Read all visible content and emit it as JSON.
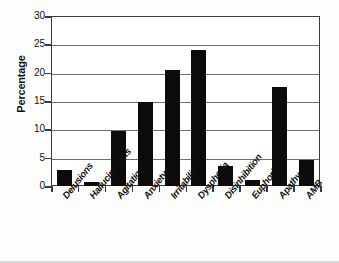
{
  "chart_data": {
    "type": "bar",
    "title": "",
    "xlabel": "",
    "ylabel": "Percentage",
    "ylim": [
      0,
      30
    ],
    "yticks": [
      0,
      5,
      10,
      15,
      20,
      25,
      30
    ],
    "ytick_labels": [
      "0",
      "5",
      "10",
      "15",
      "20",
      "25",
      "30"
    ],
    "grid": true,
    "legend": "none",
    "bar_color": "#0b0b0b",
    "categories": [
      "Delusions",
      "Hallucinations",
      "Agitation",
      "Anxiety",
      "Irritability",
      "Dysphoria",
      "Disinhibition",
      "Euphoria",
      "Apathy",
      "AMB"
    ],
    "values": [
      2.8,
      0.7,
      9.7,
      14.8,
      20.5,
      24.0,
      3.5,
      1.1,
      17.5,
      4.6
    ]
  }
}
